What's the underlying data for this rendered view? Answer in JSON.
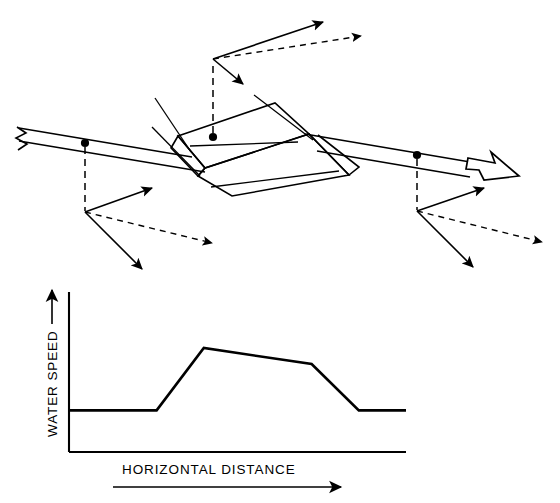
{
  "figure": {
    "title": "",
    "caption": "",
    "panels": [
      {
        "id": "flume-perspective",
        "name": "open-channel-with-sill-perspective-view",
        "description": "Perspective view of an open water channel containing a trapezoidal sill obstruction, with velocity vector triads at three measurement stations",
        "flow_direction_label": "",
        "stations": [
          {
            "id": "upstream",
            "label": "",
            "marker": "dot"
          },
          {
            "id": "over-sill",
            "label": "",
            "marker": "dot"
          },
          {
            "id": "downstream",
            "label": "",
            "marker": "dot"
          }
        ],
        "vector_components": [
          {
            "id": "resultant",
            "style": "solid",
            "label": ""
          },
          {
            "id": "horizontal-component",
            "style": "dashed",
            "label": ""
          },
          {
            "id": "vertical-component",
            "style": "solid",
            "label": ""
          }
        ]
      },
      {
        "id": "speed-profile",
        "name": "water-speed-vs-horizontal-distance-plot"
      }
    ]
  },
  "chart_data": {
    "type": "line",
    "title": "",
    "xlabel": "HORIZONTAL DISTANCE",
    "ylabel": "WATER SPEED",
    "xlabel_arrow": "→",
    "ylabel_arrow": "↑",
    "grid": false,
    "legend": null,
    "x": [
      0,
      26,
      40,
      72,
      86,
      100
    ],
    "values": [
      26,
      26,
      65,
      55,
      26,
      26
    ],
    "series": [
      {
        "name": "water speed profile",
        "values": [
          26,
          26,
          65,
          55,
          26,
          26
        ]
      }
    ],
    "xlim": [
      0,
      100
    ],
    "ylim": [
      0,
      100
    ],
    "annotations": [
      {
        "text": "baseline approach speed",
        "x": 13,
        "y": 26
      },
      {
        "text": "peak speed over crest",
        "x": 40,
        "y": 65
      },
      {
        "text": "recovered downstream speed",
        "x": 93,
        "y": 26
      }
    ],
    "tick_labels": {
      "x": [],
      "y": []
    }
  },
  "colors": {
    "ink": "#000000",
    "paper": "#ffffff"
  }
}
